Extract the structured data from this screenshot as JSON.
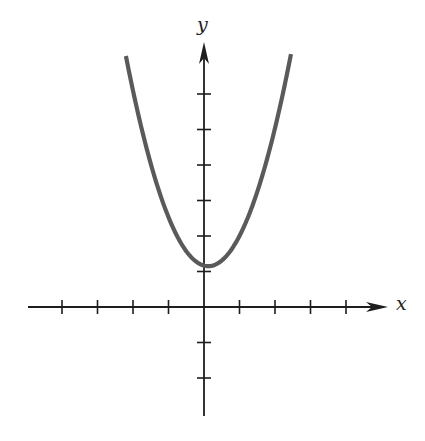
{
  "chart_data": {
    "type": "line",
    "title": "",
    "xlabel": "x",
    "ylabel": "y",
    "equation": "y = x^2 + 1 (approx.)",
    "xlim": [
      -4,
      5
    ],
    "ylim": [
      -3,
      7.5
    ],
    "grid": false,
    "legend": null,
    "x_ticks": [
      -4,
      -3,
      -2,
      -1,
      1,
      2,
      3,
      4
    ],
    "y_ticks": [
      -2,
      -1,
      1,
      2,
      3,
      4,
      5,
      6
    ],
    "tick_labels_shown": false,
    "series": [
      {
        "name": "parabola",
        "color": "#5a5a5a",
        "vertex": [
          0.12,
          1.15
        ],
        "a": 1.1,
        "x": [
          -2.2,
          -2.0,
          -1.5,
          -1.0,
          -0.5,
          0.0,
          0.12,
          0.5,
          1.0,
          1.5,
          2.0,
          2.45
        ],
        "y": [
          7.1,
          6.3,
          4.3,
          2.5,
          1.6,
          1.17,
          1.15,
          1.3,
          2.0,
          3.2,
          4.9,
          7.1
        ]
      }
    ]
  },
  "labels": {
    "x": "x",
    "y": "y"
  },
  "geometry": {
    "origin_px": [
      204,
      307
    ],
    "unit_px": 35.5,
    "x_axis_px": [
      28,
      388
    ],
    "y_axis_px": [
      416,
      42
    ],
    "tick_half_len_px": 7
  },
  "colors": {
    "axis": "#1e1e1e",
    "curve": "#5a5a5a",
    "background": "#ffffff"
  }
}
